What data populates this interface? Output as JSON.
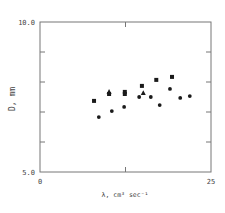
{
  "chart_data": {
    "type": "scatter",
    "title": "",
    "xlabel": "λ, cm³ sec⁻¹",
    "ylabel": "D, mm",
    "xlim": [
      0,
      25
    ],
    "ylim": [
      5.0,
      10.0
    ],
    "x_tick_labels": [
      "0",
      "25"
    ],
    "y_tick_labels": [
      "5.0",
      "10.0"
    ],
    "x_ticks": [
      0,
      12.5,
      25
    ],
    "y_ticks": [
      5,
      6,
      7,
      8,
      9,
      10
    ],
    "grid": false,
    "legend": null,
    "series": [
      {
        "name": "squares",
        "marker": "square",
        "points": [
          {
            "x": 7.9,
            "y": 7.37
          },
          {
            "x": 10.1,
            "y": 7.6
          },
          {
            "x": 12.4,
            "y": 7.67
          },
          {
            "x": 12.4,
            "y": 7.6
          },
          {
            "x": 14.9,
            "y": 7.87
          },
          {
            "x": 17.0,
            "y": 8.07
          },
          {
            "x": 19.3,
            "y": 8.17
          }
        ]
      },
      {
        "name": "triangles",
        "marker": "triangle",
        "points": [
          {
            "x": 10.1,
            "y": 7.67
          },
          {
            "x": 15.1,
            "y": 7.63
          }
        ]
      },
      {
        "name": "circles",
        "marker": "circle",
        "points": [
          {
            "x": 8.6,
            "y": 6.83
          },
          {
            "x": 10.5,
            "y": 7.03
          },
          {
            "x": 12.3,
            "y": 7.17
          },
          {
            "x": 14.5,
            "y": 7.5
          },
          {
            "x": 16.2,
            "y": 7.5
          },
          {
            "x": 17.5,
            "y": 7.23
          },
          {
            "x": 19.0,
            "y": 7.77
          },
          {
            "x": 20.5,
            "y": 7.47
          },
          {
            "x": 21.9,
            "y": 7.53
          }
        ]
      }
    ]
  },
  "plot_area": {
    "left": 40,
    "top": 22,
    "right": 211,
    "bottom": 172
  },
  "colors": {
    "axis": "#777777",
    "marker": "#1a1a1a",
    "text": "#444444"
  }
}
